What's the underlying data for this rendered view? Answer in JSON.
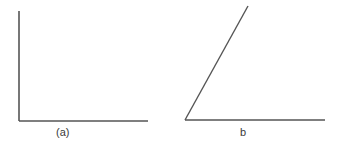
{
  "figures": [
    {
      "id": "a",
      "label": "(a)",
      "description": "Right angle formed by a vertical and a horizontal line",
      "lines": [
        {
          "x1": 19,
          "y1": 11,
          "x2": 19,
          "y2": 121
        },
        {
          "x1": 19,
          "y1": 121,
          "x2": 148,
          "y2": 121
        }
      ]
    },
    {
      "id": "b",
      "label": "b",
      "description": "Acute angle formed by a slanted line and a horizontal line",
      "lines": [
        {
          "x1": 185,
          "y1": 120,
          "x2": 248,
          "y2": 6
        },
        {
          "x1": 185,
          "y1": 120,
          "x2": 325,
          "y2": 120
        }
      ]
    }
  ],
  "colors": {
    "line": "#555555",
    "text": "#3a3a3a",
    "background": "#ffffff"
  }
}
